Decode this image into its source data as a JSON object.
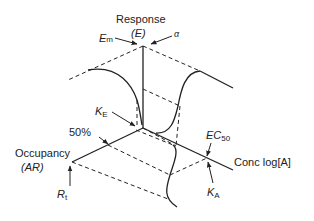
{
  "diagram": {
    "type": "3d-operational-model",
    "labels": {
      "response": "Response",
      "response_symbol": "(E)",
      "em_main": "E",
      "em_sub": "m",
      "alpha": "α",
      "ke_main": "K",
      "ke_sub": "E",
      "fifty_percent": "50%",
      "occupancy": "Occupancy",
      "occupancy_symbol": "(AR)",
      "rt_main": "R",
      "rt_sub": "t",
      "ec50_main": "EC",
      "ec50_sub": "50",
      "conc": "Conc log[A]",
      "ka_main": "K",
      "ka_sub": "A"
    },
    "axes": [
      "Response (E)",
      "Occupancy (AR)",
      "Conc log[A]"
    ],
    "colors": {
      "line": "#222222",
      "background": "#ffffff"
    }
  }
}
